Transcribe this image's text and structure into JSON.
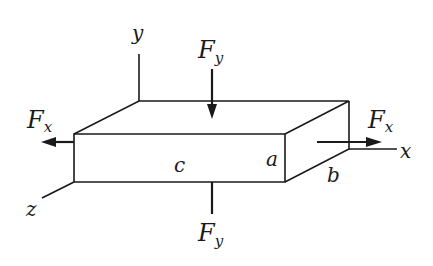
{
  "diagram": {
    "type": "3d-block-forces",
    "labels": {
      "axis_x": "x",
      "axis_y": "y",
      "axis_z": "z",
      "force_x_main": "F",
      "force_x_sub": "x",
      "force_y_main": "F",
      "force_y_sub": "y",
      "dim_a": "a",
      "dim_b": "b",
      "dim_c": "c"
    },
    "colors": {
      "stroke": "#1a1a1a",
      "background": "#ffffff"
    }
  }
}
